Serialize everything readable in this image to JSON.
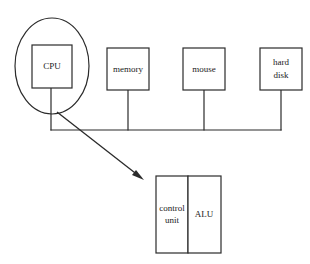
{
  "diagram": {
    "background_color": "#ffffff",
    "stroke_color": "#2b2b2b",
    "text_color": "#1a1a1a",
    "nodes": [
      {
        "id": "cpu",
        "label": "CPU",
        "shape": "rectangle",
        "x": 32,
        "y": 45,
        "width": 40,
        "height": 43,
        "highlight": "ellipse"
      },
      {
        "id": "memory",
        "label": "memory",
        "shape": "rectangle",
        "x": 107,
        "y": 48,
        "width": 42,
        "height": 42
      },
      {
        "id": "mouse",
        "label": "mouse",
        "shape": "rectangle",
        "x": 183,
        "y": 48,
        "width": 42,
        "height": 42
      },
      {
        "id": "hard-disk",
        "label": "hard disk",
        "label_lines": [
          "hard",
          "disk"
        ],
        "shape": "rectangle",
        "x": 260,
        "y": 48,
        "width": 42,
        "height": 42
      },
      {
        "id": "control-unit",
        "label": "control unit",
        "label_lines": [
          "control",
          "unit"
        ],
        "shape": "rectangle",
        "x": 156,
        "y": 176,
        "width": 32,
        "height": 77
      },
      {
        "id": "alu",
        "label": "ALU",
        "shape": "rectangle",
        "x": 188,
        "y": 176,
        "width": 33,
        "height": 77
      }
    ],
    "highlight": {
      "id": "cpu-ellipse",
      "shape": "ellipse",
      "cx": 52,
      "cy": 66,
      "rx": 37,
      "ry": 48
    },
    "bus": {
      "id": "system-bus",
      "orientation": "horizontal",
      "y": 130,
      "x_start": 51,
      "x_end": 281,
      "drops": [
        {
          "from": "cpu",
          "x": 51,
          "y_top": 88
        },
        {
          "from": "memory",
          "x": 128,
          "y_top": 90
        },
        {
          "from": "mouse",
          "x": 204,
          "y_top": 90
        },
        {
          "from": "hard-disk",
          "x": 281,
          "y_top": 90
        }
      ]
    },
    "pointer": {
      "id": "cpu-detail-arrow",
      "from": "cpu",
      "to": "cpu-internals",
      "x1": 57,
      "y1": 112,
      "x2": 144,
      "y2": 180
    }
  }
}
